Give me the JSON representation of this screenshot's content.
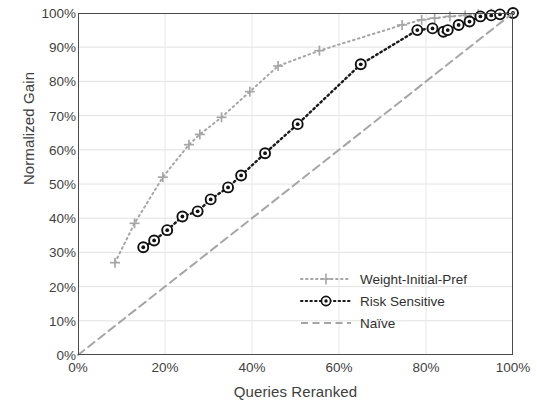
{
  "chart_data": {
    "type": "line",
    "title": "",
    "xlabel": "Queries Reranked",
    "ylabel": "Normalized Gain",
    "xlim": [
      0,
      100
    ],
    "ylim": [
      0,
      100
    ],
    "xticks": [
      "0%",
      "20%",
      "40%",
      "60%",
      "80%",
      "100%"
    ],
    "xtick_values": [
      0,
      20,
      40,
      60,
      80,
      100
    ],
    "yticks": [
      "0%",
      "10%",
      "20%",
      "30%",
      "40%",
      "50%",
      "60%",
      "70%",
      "80%",
      "90%",
      "100%"
    ],
    "ytick_values": [
      0,
      10,
      20,
      30,
      40,
      50,
      60,
      70,
      80,
      90,
      100
    ],
    "grid": true,
    "legend_position": "inside-lower-right",
    "series": [
      {
        "name": "Weight-Initial-Pref",
        "marker": "plus",
        "linestyle": "dotted",
        "color": "#a6a6a6",
        "points": [
          [
            8.5,
            27.0
          ],
          [
            13.0,
            38.5
          ],
          [
            19.5,
            52.0
          ],
          [
            25.5,
            61.5
          ],
          [
            28.0,
            64.5
          ],
          [
            33.0,
            69.5
          ],
          [
            39.5,
            77.0
          ],
          [
            46.0,
            84.5
          ],
          [
            55.5,
            89.0
          ],
          [
            74.5,
            96.5
          ],
          [
            79.0,
            98.0
          ],
          [
            82.0,
            98.5
          ],
          [
            85.5,
            99.0
          ],
          [
            89.0,
            99.3
          ],
          [
            92.0,
            99.6
          ],
          [
            95.0,
            99.8
          ],
          [
            100.0,
            100.0
          ]
        ]
      },
      {
        "name": "Risk Sensitive",
        "marker": "circle-dot",
        "linestyle": "dotted",
        "color": "#1a1a1a",
        "points": [
          [
            15.0,
            31.5
          ],
          [
            17.5,
            33.5
          ],
          [
            20.5,
            36.5
          ],
          [
            24.0,
            40.5
          ],
          [
            27.5,
            42.0
          ],
          [
            30.5,
            45.5
          ],
          [
            34.5,
            49.0
          ],
          [
            37.5,
            52.5
          ],
          [
            43.0,
            59.0
          ],
          [
            50.5,
            67.5
          ],
          [
            65.0,
            85.0
          ],
          [
            78.0,
            95.0
          ],
          [
            81.5,
            95.5
          ],
          [
            84.0,
            94.5
          ],
          [
            85.0,
            95.0
          ],
          [
            87.5,
            96.5
          ],
          [
            90.0,
            97.5
          ],
          [
            92.5,
            99.0
          ],
          [
            95.0,
            99.3
          ],
          [
            97.0,
            99.6
          ],
          [
            100.0,
            100.0
          ]
        ]
      },
      {
        "name": "Naïve",
        "marker": "none",
        "linestyle": "dashed",
        "color": "#a6a6a6",
        "points": [
          [
            0.0,
            0.0
          ],
          [
            100.0,
            100.0
          ]
        ]
      }
    ]
  },
  "legend": {
    "items": [
      {
        "label": "Weight-Initial-Pref"
      },
      {
        "label": "Risk Sensitive"
      },
      {
        "label": "Naïve"
      }
    ]
  }
}
